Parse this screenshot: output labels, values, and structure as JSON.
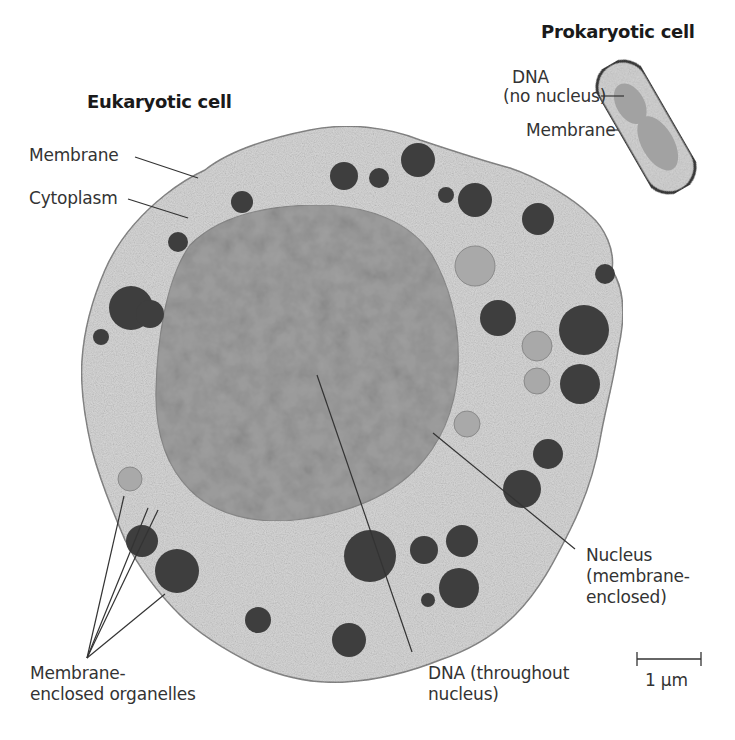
{
  "figure": {
    "colors": {
      "background": "#ffffff",
      "cytoplasm": "#d9d9d9",
      "nucleus": "#9c9c9c",
      "organelle_dark": "#3f3f3f",
      "organelle_light": "#a8a8a8",
      "membrane": "#4a4a4a",
      "leader_line": "#333333",
      "prokaryote_body": "#d4d4d4",
      "prokaryote_dna": "#a0a0a0"
    }
  },
  "prokaryote": {
    "title": "Prokaryotic cell",
    "labels": {
      "dna_line1": "DNA",
      "dna_line2": "(no nucleus)",
      "membrane": "Membrane"
    }
  },
  "eukaryote": {
    "title": "Eukaryotic cell",
    "labels": {
      "membrane": "Membrane",
      "cytoplasm": "Cytoplasm",
      "organelles_line1": "Membrane-",
      "organelles_line2": "enclosed organelles",
      "nucleus_line1": "Nucleus",
      "nucleus_line2": "(membrane-",
      "nucleus_line3": "enclosed)",
      "dna_line1": "DNA (throughout",
      "dna_line2": "nucleus)"
    }
  },
  "scale_bar": {
    "label": "1 µm"
  }
}
